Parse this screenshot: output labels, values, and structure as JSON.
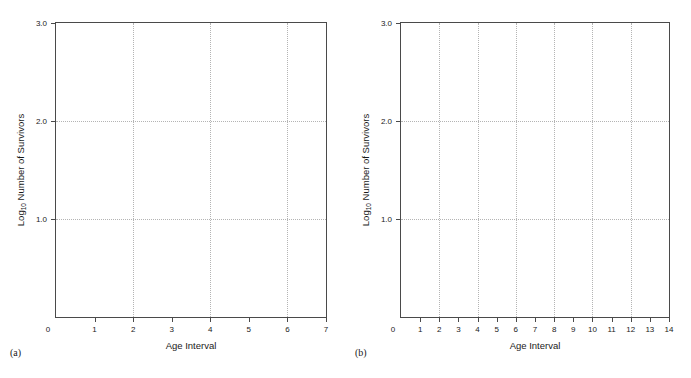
{
  "figure": {
    "background": "#ffffff",
    "axis_color": "#4a4a4a",
    "grid_color": "#b4b4b4",
    "text_color": "#1a1a1a"
  },
  "panels": [
    {
      "caption": "(a)",
      "xlabel": "Age Interval",
      "ylabel_main": "Number of Survivors",
      "ylabel_prefix": "Log",
      "ylabel_subscript": "10",
      "xticks": [
        "0",
        "1",
        "2",
        "3",
        "4",
        "5",
        "6",
        "7"
      ],
      "yticks": [
        "1.0",
        "2.0",
        "3.0"
      ]
    },
    {
      "caption": "(b)",
      "xlabel": "Age Interval",
      "ylabel_main": "Number of Survivors",
      "ylabel_prefix": "Log",
      "ylabel_subscript": "10",
      "xticks": [
        "0",
        "1",
        "2",
        "3",
        "4",
        "5",
        "6",
        "7",
        "8",
        "9",
        "10",
        "11",
        "12",
        "13",
        "14"
      ],
      "yticks": [
        "1.0",
        "2.0",
        "3.0"
      ]
    }
  ],
  "chart_data": [
    {
      "type": "line",
      "panel": "(a)",
      "title": "",
      "xlabel": "Age Interval",
      "ylabel": "Log10 Number of Survivors",
      "xlim": [
        0,
        7
      ],
      "ylim": [
        0,
        3.0
      ],
      "xticks": [
        0,
        1,
        2,
        3,
        4,
        5,
        6,
        7
      ],
      "yticks": [
        1.0,
        2.0,
        3.0
      ],
      "xgrid_at": [
        2,
        4,
        6
      ],
      "ygrid_at": [
        1.0,
        2.0
      ],
      "grid": true,
      "legend": null,
      "series": [],
      "x": [],
      "values": [],
      "note": "Empty plot frame - axes and gridlines only, no plotted data"
    },
    {
      "type": "line",
      "panel": "(b)",
      "title": "",
      "xlabel": "Age Interval",
      "ylabel": "Log10 Number of Survivors",
      "xlim": [
        0,
        14
      ],
      "ylim": [
        0,
        3.0
      ],
      "xticks": [
        0,
        1,
        2,
        3,
        4,
        5,
        6,
        7,
        8,
        9,
        10,
        11,
        12,
        13,
        14
      ],
      "yticks": [
        1.0,
        2.0,
        3.0
      ],
      "xgrid_at": [
        2,
        4,
        6,
        8,
        10,
        12
      ],
      "ygrid_at": [
        1.0,
        2.0
      ],
      "grid": true,
      "legend": null,
      "series": [],
      "x": [],
      "values": [],
      "note": "Empty plot frame - axes and gridlines only, no plotted data"
    }
  ]
}
